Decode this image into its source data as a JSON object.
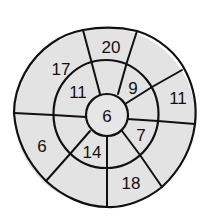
{
  "diagram": {
    "type": "bullseye-segment-map",
    "fill_color": "#e3e3e3",
    "line_color": "#111111",
    "center": {
      "label": "6"
    },
    "inner_ring": [
      {
        "position": "upper-left",
        "label": "11"
      },
      {
        "position": "upper-right",
        "label": "9"
      },
      {
        "position": "lower-right",
        "label": "7"
      },
      {
        "position": "lower-left",
        "label": "14"
      }
    ],
    "outer_ring": [
      {
        "position": "top",
        "label": "20"
      },
      {
        "position": "upper-left",
        "label": "17"
      },
      {
        "position": "right",
        "label": "11"
      },
      {
        "position": "left",
        "label": "6"
      },
      {
        "position": "bottom",
        "label": "18"
      }
    ]
  }
}
